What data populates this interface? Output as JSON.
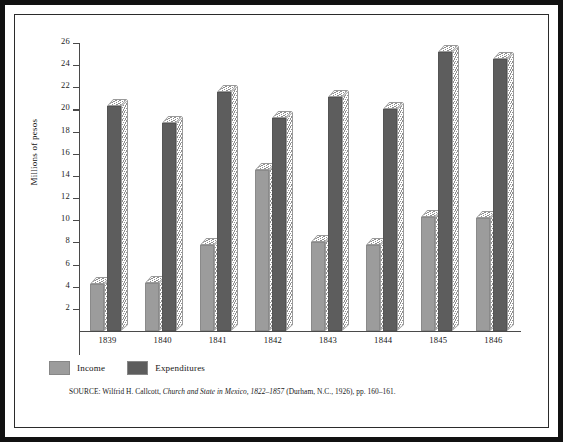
{
  "figure": {
    "ylabel": "Millions of pesos",
    "source_prefix": "SOURCE: Wilfrid H. Callcott,",
    "source_title": "Church and State in Mexico, 1822–1857",
    "source_suffix": "(Durham, N.C., 1926), pp. 160–161."
  },
  "legend": {
    "position": "bottom-left",
    "items": [
      {
        "label": "Income",
        "color": "#9c9c9c"
      },
      {
        "label": "Expenditures",
        "color": "#5d5d5d"
      }
    ]
  },
  "chart_data": {
    "type": "bar",
    "title": "",
    "xlabel": "",
    "ylabel": "Millions of pesos",
    "categories": [
      "1839",
      "1840",
      "1841",
      "1842",
      "1843",
      "1844",
      "1845",
      "1846"
    ],
    "series": [
      {
        "name": "Income",
        "color": "#9c9c9c",
        "values": [
          4.2,
          4.3,
          7.8,
          14.5,
          8.0,
          7.8,
          10.3,
          10.2
        ]
      },
      {
        "name": "Expenditures",
        "color": "#5d5d5d",
        "values": [
          20.3,
          18.8,
          21.6,
          19.2,
          21.1,
          20.0,
          25.2,
          24.6
        ]
      }
    ],
    "ylim": [
      0,
      26
    ],
    "ytick_step": 2,
    "yticks": [
      2,
      4,
      6,
      8,
      10,
      12,
      14,
      16,
      18,
      20,
      22,
      24,
      26
    ],
    "ytick_labels": [
      "2",
      "4",
      "6",
      "8",
      "10",
      "12",
      "14",
      "16",
      "18",
      "20",
      "22",
      "24",
      "26"
    ],
    "grid": false,
    "legend_position": "bottom-left",
    "bar_style": "3d-extruded-hatched"
  }
}
